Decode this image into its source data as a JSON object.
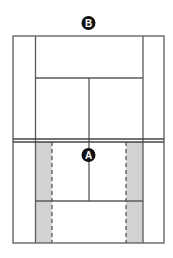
{
  "diagram": {
    "type": "tennis-court-top-view",
    "markers": [
      {
        "id": "B",
        "label": "B",
        "position": "behind far baseline"
      },
      {
        "id": "A",
        "label": "A",
        "position": "at net, center"
      }
    ],
    "highlight": {
      "description": "shaded strips inside near-side singles sidelines, bounded by dashed lines",
      "color": "#d0d0d0"
    },
    "colors": {
      "lines": "#555555",
      "marker_fill": "#111111",
      "marker_text": "#ffffff",
      "background": "#ffffff"
    }
  }
}
